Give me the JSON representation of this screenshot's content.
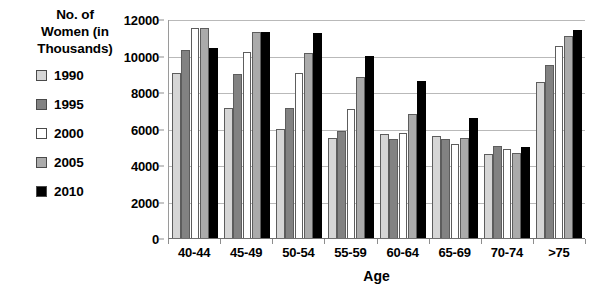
{
  "legend": {
    "title": "No. of Women (in Thousands)",
    "title_lines": [
      "No. of",
      "Women (in",
      "Thousands)"
    ],
    "items": [
      {
        "label": "1990",
        "color": "#d6d6d6",
        "swatch_name": "legend-swatch-1990"
      },
      {
        "label": "1995",
        "color": "#828282",
        "swatch_name": "legend-swatch-1995"
      },
      {
        "label": "2000",
        "color": "#ffffff",
        "swatch_name": "legend-swatch-2000"
      },
      {
        "label": "2005",
        "color": "#ababab",
        "swatch_name": "legend-swatch-2005"
      },
      {
        "label": "2010",
        "color": "#000000",
        "swatch_name": "legend-swatch-2010"
      }
    ]
  },
  "axes": {
    "x_title": "Age",
    "y_title": "No. of Women (in Thousands)",
    "y_ticks": [
      "0",
      "2000",
      "4000",
      "6000",
      "8000",
      "10000",
      "12000"
    ],
    "x_ticks": [
      "40-44",
      "45-49",
      "50-54",
      "55-59",
      "60-64",
      "65-69",
      "70-74",
      ">75"
    ]
  },
  "chart_data": {
    "type": "bar",
    "title": "No. of Women (in Thousands)",
    "xlabel": "Age",
    "ylabel": "No. of Women (in Thousands)",
    "ylim": [
      0,
      12000
    ],
    "ytick_step": 2000,
    "grid": true,
    "legend_position": "left",
    "categories": [
      "40-44",
      "45-49",
      "50-54",
      "55-59",
      "60-64",
      "65-69",
      "70-74",
      ">75"
    ],
    "series": [
      {
        "name": "1990",
        "color": "#d6d6d6",
        "values": [
          9050,
          7100,
          5950,
          5500,
          5700,
          5600,
          4600,
          8550
        ]
      },
      {
        "name": "1995",
        "color": "#828282",
        "values": [
          10300,
          9000,
          7100,
          5850,
          5400,
          5450,
          5050,
          9500
        ]
      },
      {
        "name": "2000",
        "color": "#ffffff",
        "values": [
          11500,
          10200,
          9050,
          7050,
          5750,
          5150,
          4900,
          10500
        ]
      },
      {
        "name": "2005",
        "color": "#ababab",
        "values": [
          11500,
          11300,
          10150,
          8800,
          6800,
          5500,
          4650,
          11050
        ]
      },
      {
        "name": "2010",
        "color": "#000000",
        "values": [
          10400,
          11300,
          11250,
          10000,
          8600,
          6600,
          5000,
          11400
        ]
      }
    ]
  }
}
